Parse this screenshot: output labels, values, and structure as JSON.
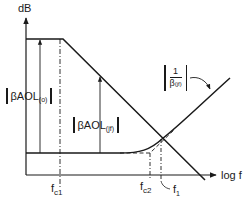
{
  "diagram": {
    "axes": {
      "y_label": "dB",
      "x_label": "log f"
    },
    "curves": [
      {
        "name": "open-loop-gain",
        "description": "flat at high level, breaks at fc1, rolls off at -20 dB/decade"
      },
      {
        "name": "inverse-beta",
        "label": "1/β(jf)",
        "description": "flat low level, rises after fc2"
      },
      {
        "name": "closed-loop-asymptote",
        "description": "dashed asymptote of feedback curve"
      }
    ],
    "labels": {
      "loop_gain_low_freq": {
        "main": "βAOL",
        "sub": "(o)"
      },
      "loop_gain_at_f": {
        "main": "βAOL",
        "sub": "(jf)"
      },
      "inverse_beta": {
        "num": "1",
        "den_main": "β",
        "den_sub": "(jf)"
      },
      "fc1": {
        "main": "f",
        "sub": "c1"
      },
      "fc2": {
        "main": "f",
        "sub": "c2"
      },
      "f1": {
        "main": "f",
        "sub": "1"
      }
    },
    "colors": {
      "stroke": "#1a1a1a",
      "background": "#ffffff"
    }
  }
}
